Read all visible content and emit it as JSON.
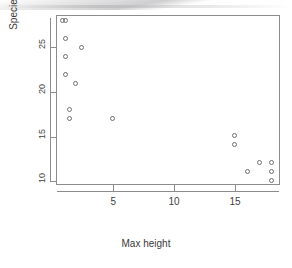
{
  "chart_data": {
    "type": "scatter",
    "title": "",
    "xlabel": "Max height",
    "ylabel": "Species richness",
    "xlim": [
      0.3,
      18.7
    ],
    "ylim": [
      9.6,
      28.6
    ],
    "xticks": [
      5,
      10,
      15
    ],
    "yticks": [
      10,
      15,
      20,
      25
    ],
    "grid": false,
    "legend": null,
    "marker": "open-circle",
    "marker_color": "#6f6f6f",
    "x": [
      0.8,
      1.1,
      1.1,
      2.4,
      1.1,
      1.1,
      1.9,
      1.4,
      1.4,
      4.9,
      15.0,
      15.0,
      17.0,
      18.0,
      16.0,
      18.0,
      18.0
    ],
    "y": [
      28.0,
      28.0,
      26.0,
      25.0,
      24.0,
      22.0,
      21.0,
      18.0,
      17.0,
      17.0,
      15.1,
      14.1,
      12.1,
      12.1,
      11.1,
      11.1,
      10.1
    ],
    "points": [
      {
        "label": "1",
        "x": 0.8,
        "y": 28.0
      },
      {
        "label": "2",
        "x": 1.1,
        "y": 28.0
      },
      {
        "label": "3",
        "x": 1.1,
        "y": 26.0
      },
      {
        "label": "4",
        "x": 2.4,
        "y": 25.0
      },
      {
        "label": "5",
        "x": 1.1,
        "y": 24.0
      },
      {
        "label": "6",
        "x": 1.1,
        "y": 22.0
      },
      {
        "label": "7",
        "x": 1.9,
        "y": 21.0
      },
      {
        "label": "8",
        "x": 1.4,
        "y": 18.0
      },
      {
        "label": "9",
        "x": 1.4,
        "y": 17.0
      },
      {
        "label": "10",
        "x": 4.9,
        "y": 17.0
      },
      {
        "label": "11",
        "x": 15.0,
        "y": 15.1
      },
      {
        "label": "12",
        "x": 15.0,
        "y": 14.1
      },
      {
        "label": "13",
        "x": 17.0,
        "y": 12.1
      },
      {
        "label": "14",
        "x": 18.0,
        "y": 12.1
      },
      {
        "label": "15",
        "x": 16.0,
        "y": 11.1
      },
      {
        "label": "16",
        "x": 18.0,
        "y": 11.1
      },
      {
        "label": "17",
        "x": 18.0,
        "y": 10.1
      }
    ]
  },
  "axes": {
    "x_title": "Max height",
    "y_title": "Species richness",
    "x_tick_labels": [
      "5",
      "10",
      "15"
    ],
    "y_tick_labels": [
      "10",
      "15",
      "20",
      "25"
    ]
  }
}
